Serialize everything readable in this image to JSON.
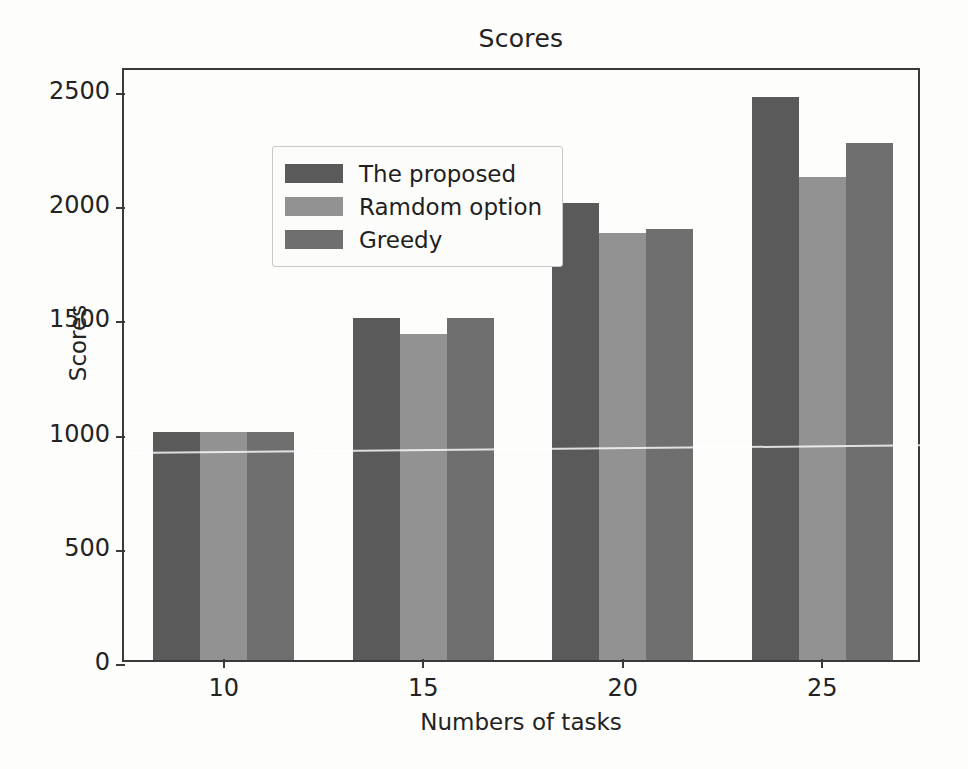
{
  "chart_data": {
    "type": "bar",
    "title": "Scores",
    "xlabel": "Numbers of tasks",
    "ylabel": "Scores",
    "categories": [
      "10",
      "15",
      "20",
      "25"
    ],
    "series": [
      {
        "name": "The proposed",
        "color": "#5a5a5a",
        "values": [
          1000,
          1495,
          2000,
          2465
        ]
      },
      {
        "name": "Ramdom option",
        "color": "#929292",
        "values": [
          1000,
          1425,
          1870,
          2115
        ]
      },
      {
        "name": "Greedy",
        "color": "#6f6f6f",
        "values": [
          1000,
          1495,
          1885,
          2265
        ]
      }
    ],
    "ylim": [
      0,
      2600
    ],
    "yticks": [
      0,
      500,
      1000,
      1500,
      2000,
      2500
    ],
    "ytick_labels": [
      "0",
      "500",
      "1000",
      "1500",
      "2000",
      "2500"
    ],
    "xtick_labels": [
      "10",
      "15",
      "20",
      "25"
    ],
    "grid": false,
    "legend_position": "upper left"
  },
  "legend": {
    "items": [
      {
        "label": "The proposed",
        "swatch": "#5a5a5a"
      },
      {
        "label": "Ramdom option",
        "swatch": "#929292"
      },
      {
        "label": "Greedy",
        "swatch": "#6f6f6f"
      }
    ]
  }
}
